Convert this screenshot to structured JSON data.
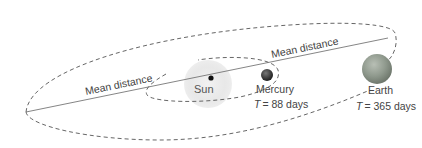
{
  "diagram": {
    "type": "orbital-diagram",
    "bodies": [
      {
        "id": "sun",
        "label": "Sun",
        "color": "#e6e6e6"
      },
      {
        "id": "mercury",
        "label": "Mercury",
        "period_label": "T = 88 days",
        "period_var": "T",
        "period_value": "= 88 days",
        "color": "#333333"
      },
      {
        "id": "earth",
        "label": "Earth",
        "period_label": "T = 365 days",
        "period_var": "T",
        "period_value": "= 365 days",
        "color": "#8e9a8c"
      }
    ],
    "labels": {
      "mean_distance_mercury": "Mean distance",
      "mean_distance_earth": "Mean distance"
    },
    "orbit_style": "dashed",
    "line_color": "#555555"
  }
}
